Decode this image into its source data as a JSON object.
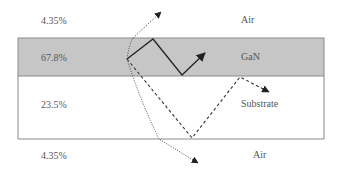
{
  "layers": [
    {
      "name": "Air",
      "percent": "4.35%",
      "position": "top"
    },
    {
      "name": "GaN",
      "percent": "67.8%",
      "position": "gan"
    },
    {
      "name": "Substrate",
      "percent": "23.5%",
      "position": "substrate"
    },
    {
      "name": "Air",
      "percent": "4.35%",
      "position": "bottom"
    }
  ],
  "colors": {
    "gan_fill": "#c6c6c6",
    "border": "#8a8a8a",
    "ray": "#222222"
  },
  "rays": [
    {
      "style": "solid",
      "description": "guided in GaN"
    },
    {
      "style": "dotted",
      "description": "escape to top air"
    },
    {
      "style": "dashed",
      "description": "substrate mode"
    },
    {
      "style": "dotted",
      "description": "escape to bottom air"
    }
  ]
}
